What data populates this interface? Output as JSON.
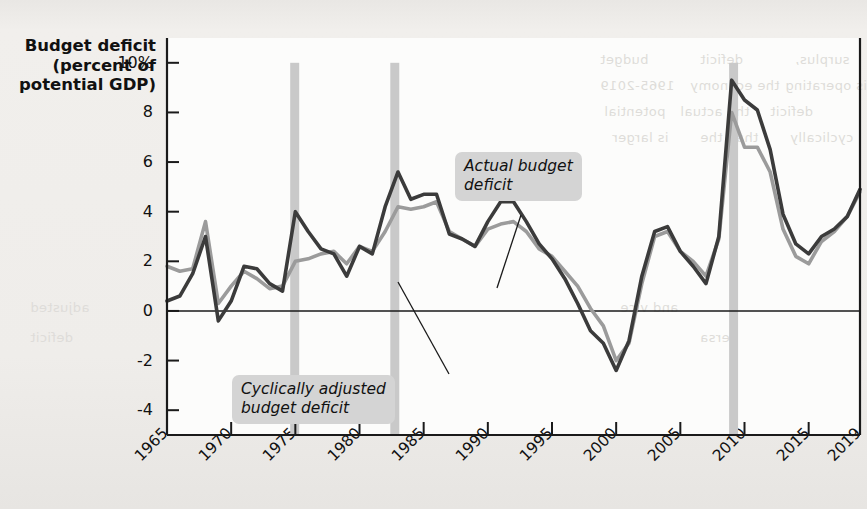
{
  "figure": {
    "y_axis_title": "Budget deficit\n(percent of\npotential\nGDP)",
    "background_color": "#eceae7",
    "plot_background_color": "#fcfcfb"
  },
  "annotations": [
    {
      "id": "actual",
      "text": "Actual budget\ndeficit"
    },
    {
      "id": "cyclical",
      "text": "Cyclically adjusted\nbudget deficit"
    }
  ],
  "bleed_text": [
    "budget",
    "deficit",
    "surplus,",
    "1965-2019",
    "the economy",
    "is operating",
    "potential",
    "the actual",
    "deficit",
    "is larger",
    "than the",
    "cyclically",
    "adjusted",
    "deficit",
    "and vice",
    "versa"
  ],
  "chart_data": {
    "type": "line",
    "title": "",
    "xlabel": "",
    "ylabel": "Budget deficit (percent of potential GDP)",
    "xlim": [
      1965,
      2019
    ],
    "ylim": [
      -5,
      11
    ],
    "yticks": [
      10,
      8,
      6,
      4,
      2,
      0,
      -2,
      -4
    ],
    "ytick_labels": [
      "10%",
      "8",
      "6",
      "4",
      "2",
      "0",
      "-2",
      "-4"
    ],
    "xticks": [
      1965,
      1970,
      1975,
      1980,
      1985,
      1990,
      1995,
      2000,
      2005,
      2010,
      2015,
      2019
    ],
    "xtick_labels": [
      "1965",
      "1970",
      "1975",
      "1980",
      "1985",
      "1990",
      "1995",
      "2000",
      "2005",
      "2010",
      "2015",
      "2019"
    ],
    "grid": false,
    "legend": "annotated-callouts",
    "zero_line": 0,
    "colors": {
      "actual": "#3b3b3b",
      "cyclically_adjusted": "#9b9b9b",
      "recession_band": "#c9c9c9",
      "axis": "#1a1a1a"
    },
    "recession_bands": [
      {
        "start": 1974.6,
        "end": 1975.3
      },
      {
        "start": 1982.4,
        "end": 1983.1
      },
      {
        "start": 2008.8,
        "end": 2009.5
      }
    ],
    "x": [
      1965,
      1966,
      1967,
      1968,
      1969,
      1970,
      1971,
      1972,
      1973,
      1974,
      1975,
      1976,
      1977,
      1978,
      1979,
      1980,
      1981,
      1982,
      1983,
      1984,
      1985,
      1986,
      1987,
      1988,
      1989,
      1990,
      1991,
      1992,
      1993,
      1994,
      1995,
      1996,
      1997,
      1998,
      1999,
      2000,
      2001,
      2002,
      2003,
      2004,
      2005,
      2006,
      2007,
      2008,
      2009,
      2010,
      2011,
      2012,
      2013,
      2014,
      2015,
      2016,
      2017,
      2018,
      2019
    ],
    "series": [
      {
        "name": "Actual budget deficit",
        "color": "#3b3b3b",
        "values": [
          0.4,
          0.6,
          1.5,
          3.0,
          -0.4,
          0.4,
          1.8,
          1.7,
          1.1,
          0.8,
          4.0,
          3.2,
          2.5,
          2.3,
          1.4,
          2.6,
          2.3,
          4.2,
          5.6,
          4.5,
          4.7,
          4.7,
          3.1,
          2.9,
          2.6,
          3.6,
          4.4,
          4.4,
          3.6,
          2.7,
          2.1,
          1.3,
          0.3,
          -0.8,
          -1.3,
          -2.4,
          -1.2,
          1.4,
          3.2,
          3.4,
          2.4,
          1.8,
          1.1,
          3.0,
          9.3,
          8.5,
          8.1,
          6.5,
          3.9,
          2.7,
          2.3,
          3.0,
          3.3,
          3.8,
          4.9
        ]
      },
      {
        "name": "Cyclically adjusted budget deficit",
        "color": "#9b9b9b",
        "values": [
          1.8,
          1.6,
          1.7,
          3.6,
          0.3,
          1.0,
          1.6,
          1.3,
          0.9,
          1.0,
          2.0,
          2.1,
          2.3,
          2.4,
          1.9,
          2.6,
          2.4,
          3.2,
          4.2,
          4.1,
          4.2,
          4.4,
          3.2,
          2.9,
          2.6,
          3.3,
          3.5,
          3.6,
          3.2,
          2.5,
          2.2,
          1.6,
          1.0,
          0.1,
          -0.6,
          -2.0,
          -1.3,
          1.1,
          3.0,
          3.2,
          2.4,
          2.0,
          1.4,
          2.9,
          8.0,
          6.6,
          6.6,
          5.6,
          3.3,
          2.2,
          1.9,
          2.8,
          3.2,
          3.8,
          4.8
        ]
      }
    ]
  }
}
